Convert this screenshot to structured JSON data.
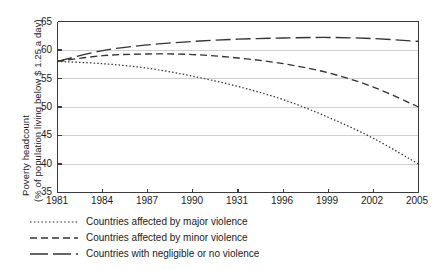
{
  "chart_data": {
    "type": "line",
    "title": "",
    "xlabel": "",
    "ylabel_line1": "Poverty headcount",
    "ylabel_line2": "(% of population living below $ 1.25 a day)",
    "xlim": [
      1981,
      2005
    ],
    "ylim": [
      35,
      65
    ],
    "grid": true,
    "legend_position": "below",
    "y_ticks": [
      "65",
      "60",
      "55",
      "50",
      "45",
      "40",
      "35"
    ],
    "y_tick_values": [
      65,
      60,
      55,
      50,
      45,
      40,
      35
    ],
    "x_ticks": [
      "1981",
      "1984",
      "1987",
      "1990",
      "1931",
      "1996",
      "1999",
      "2002",
      "2005"
    ],
    "x_tick_values": [
      1981,
      1984,
      1987,
      1990,
      1993,
      1996,
      1999,
      2002,
      2005
    ],
    "x": [
      1981,
      1984,
      1987,
      1990,
      1993,
      1996,
      1999,
      2002,
      2005
    ],
    "series": [
      {
        "name": "Countries affected by major violence",
        "style": "dotted",
        "color": "#333333",
        "values": [
          58.0,
          57.6,
          56.8,
          55.4,
          53.6,
          51.3,
          48.2,
          44.5,
          40.0
        ]
      },
      {
        "name": "Countries affected by minor violence",
        "style": "dashed",
        "color": "#333333",
        "values": [
          58.0,
          59.0,
          59.3,
          59.2,
          58.6,
          57.6,
          56.0,
          53.5,
          50.0
        ]
      },
      {
        "name": "Countries with negligible or no violence",
        "style": "long-dash",
        "color": "#333333",
        "values": [
          58.0,
          59.9,
          60.9,
          61.5,
          61.9,
          62.1,
          62.2,
          62.0,
          61.5
        ]
      }
    ]
  },
  "legend": {
    "items": [
      {
        "label": "Countries affected by major violence"
      },
      {
        "label": "Countries affected by minor violence"
      },
      {
        "label": "Countries with negligible or no violence"
      }
    ]
  },
  "colors": {
    "axis": "#3a3a3a",
    "grid": "#cfcfcf",
    "line": "#333333",
    "background": "#ffffff",
    "text": "#1a1a1a"
  }
}
